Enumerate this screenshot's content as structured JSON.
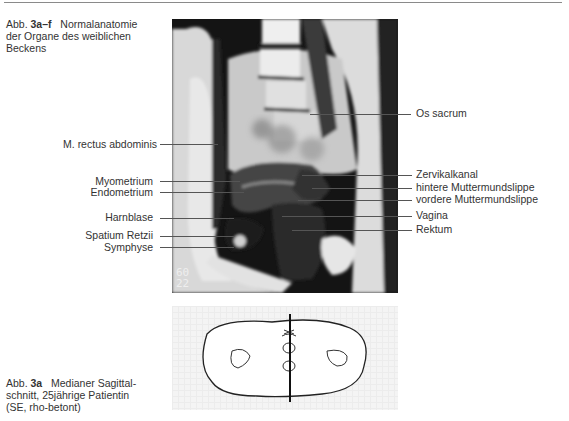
{
  "header_rule": true,
  "figure_caption_top": {
    "prefix": "Abb.",
    "number": "3a–f",
    "line1_rest": "Normalanatomie",
    "line2": "der Organe des weiblichen",
    "line3": "Beckens"
  },
  "mri": {
    "scan_numbers": [
      "60",
      "22"
    ]
  },
  "labels_left": [
    {
      "text": "M. rectus abdominis"
    },
    {
      "text": "Myometrium"
    },
    {
      "text": "Endometrium"
    },
    {
      "text": "Harnblase"
    },
    {
      "text": "Spatium Retzii"
    },
    {
      "text": "Symphyse"
    }
  ],
  "labels_right": [
    {
      "text": "Os sacrum"
    },
    {
      "text": "Zervikalkanal"
    },
    {
      "text": "hintere Muttermundslippe"
    },
    {
      "text": "vordere Muttermundslippe"
    },
    {
      "text": "Vagina"
    },
    {
      "text": "Rektum"
    }
  ],
  "figure_caption_bottom": {
    "prefix": "Abb.",
    "number": "3a",
    "line1_rest": "Medianer Sagittal-",
    "line2": "schnitt, 25jährige Patientin",
    "line3": "(SE, rho-betont)"
  }
}
